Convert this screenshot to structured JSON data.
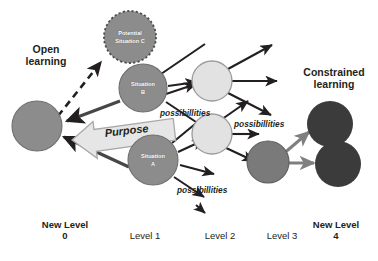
{
  "diagram": {
    "title_open": "Open\nlearning",
    "title_constrained": "Constrained\nlearning",
    "purpose_label": "Purpose",
    "possibilities_label": "possibillities",
    "nodes": [
      {
        "id": "start",
        "label": "",
        "level": "New Level 0",
        "fill": "#8c8c8c"
      },
      {
        "id": "potential-c",
        "label": "Potential\nSituation C",
        "level": "Level 1",
        "fill": "#8c8c8c"
      },
      {
        "id": "situation-b",
        "label": "Situation\nB",
        "level": "Level 1",
        "fill": "#8c8c8c"
      },
      {
        "id": "situation-a",
        "label": "Situation\nA",
        "level": "Level 1",
        "fill": "#8c8c8c"
      },
      {
        "id": "level2-node",
        "label": "",
        "level": "Level 2",
        "fill": "#e2e2e2"
      },
      {
        "id": "level3-node",
        "label": "",
        "level": "Level 3",
        "fill": "#7a7a7a"
      },
      {
        "id": "level4-upper",
        "label": "",
        "level": "New Level 4",
        "fill": "#3b3b3b"
      },
      {
        "id": "level4-lower",
        "label": "",
        "level": "New Level 4",
        "fill": "#3b3b3b"
      }
    ],
    "possibilities_labels": [
      {
        "id": "poss-1",
        "text": "possibillities"
      },
      {
        "id": "poss-2",
        "text": "possibillities"
      },
      {
        "id": "poss-3",
        "text": "possibillities"
      }
    ],
    "axis_levels": [
      {
        "id": "level-0",
        "text": "New Level\n0",
        "bold": true
      },
      {
        "id": "level-1",
        "text": "Level 1",
        "bold": false
      },
      {
        "id": "level-2",
        "text": "Level 2",
        "bold": false
      },
      {
        "id": "level-3",
        "text": "Level 3",
        "bold": false
      },
      {
        "id": "level-4",
        "text": "New Level\n4",
        "bold": true
      }
    ],
    "colors": {
      "node_mid_grey": "#8c8c8c",
      "node_light_grey": "#e2e2e2",
      "node_dark_grey": "#3b3b3b",
      "arrow_black": "#231f20",
      "arrow_grey": "#7f7f7f",
      "banner_fill": "#e6e6e6",
      "text": "#231f20",
      "background": "#ffffff"
    }
  }
}
